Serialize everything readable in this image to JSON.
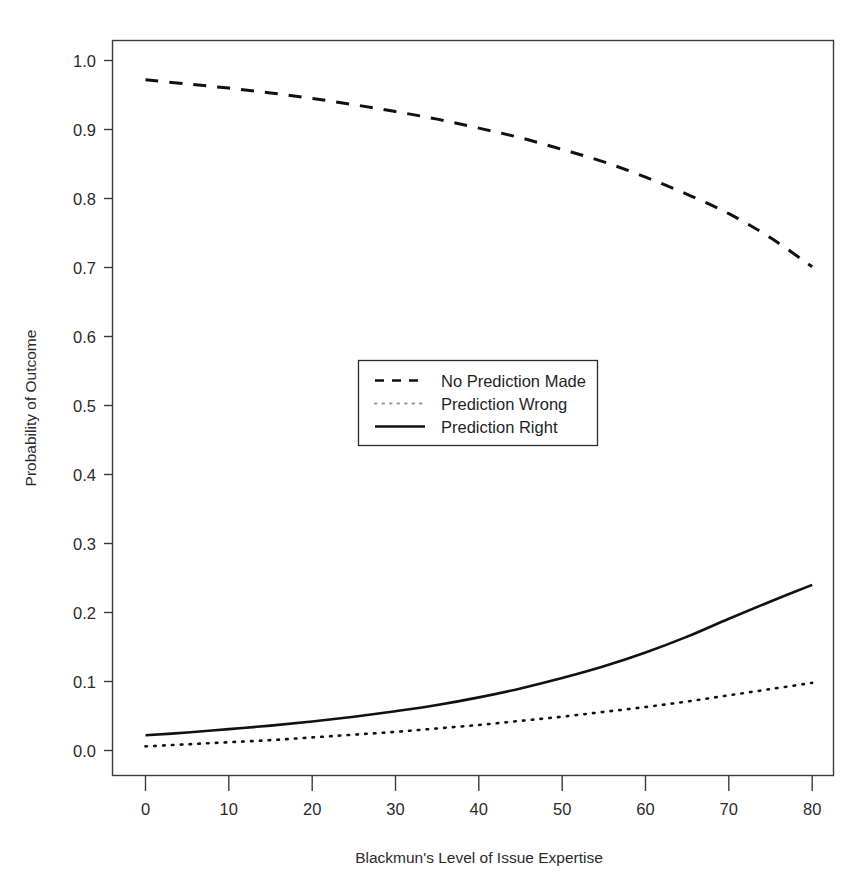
{
  "chart_data": {
    "type": "line",
    "title": "",
    "xlabel": "Blackmun's Level of Issue Expertise",
    "ylabel": "Probability of Outcome",
    "xlim": [
      -4,
      84
    ],
    "ylim": [
      -0.03,
      1.04
    ],
    "xticks": [
      0,
      10,
      20,
      30,
      40,
      50,
      60,
      70,
      80
    ],
    "xtick_labels": [
      "0",
      "10",
      "20",
      "30",
      "40",
      "50",
      "60",
      "70",
      "80"
    ],
    "yticks": [
      0.0,
      0.1,
      0.2,
      0.3,
      0.4,
      0.5,
      0.6,
      0.7,
      0.8,
      0.9,
      1.0
    ],
    "ytick_labels": [
      "0.0",
      "0.1",
      "0.2",
      "0.3",
      "0.4",
      "0.5",
      "0.6",
      "0.7",
      "0.8",
      "0.9",
      "1.0"
    ],
    "grid": false,
    "legend_position": "center",
    "x": [
      0,
      5,
      10,
      15,
      20,
      25,
      30,
      35,
      40,
      45,
      50,
      55,
      60,
      65,
      70,
      75,
      80
    ],
    "series": [
      {
        "name": "No Prediction Made",
        "style": "dashed",
        "color": "#111111",
        "values": [
          0.972,
          0.966,
          0.96,
          0.953,
          0.945,
          0.936,
          0.926,
          0.915,
          0.902,
          0.888,
          0.871,
          0.853,
          0.831,
          0.806,
          0.778,
          0.743,
          0.701
        ]
      },
      {
        "name": "Prediction Wrong",
        "style": "dotted",
        "color": "#111111",
        "values": [
          0.006,
          0.009,
          0.012,
          0.015,
          0.019,
          0.023,
          0.027,
          0.032,
          0.037,
          0.043,
          0.049,
          0.056,
          0.063,
          0.071,
          0.08,
          0.089,
          0.098
        ]
      },
      {
        "name": "Prediction Right",
        "style": "solid",
        "color": "#111111",
        "values": [
          0.022,
          0.026,
          0.031,
          0.036,
          0.042,
          0.049,
          0.057,
          0.066,
          0.077,
          0.09,
          0.105,
          0.122,
          0.142,
          0.165,
          0.191,
          0.216,
          0.24
        ]
      }
    ],
    "legend_entries": [
      {
        "label": "No Prediction Made",
        "style": "dashed"
      },
      {
        "label": "Prediction Wrong",
        "style": "dotted"
      },
      {
        "label": "Prediction Right",
        "style": "solid"
      }
    ]
  }
}
